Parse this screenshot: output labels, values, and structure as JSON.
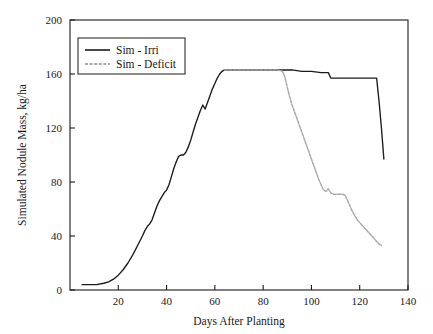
{
  "chart_data": {
    "type": "line",
    "title": "",
    "xlabel": "Days After Planting",
    "ylabel": "Simulated Nodule Mass, kg/ha",
    "xlim": [
      0,
      140
    ],
    "ylim": [
      0,
      200
    ],
    "xticks": [
      20,
      40,
      60,
      80,
      100,
      120,
      140
    ],
    "yticks": [
      0,
      40,
      80,
      120,
      160,
      200
    ],
    "grid": false,
    "legend_position": "top-left",
    "series": [
      {
        "name": "Sim - Irri",
        "color": "#1a1a1a",
        "style": "solid",
        "points": [
          [
            5,
            4
          ],
          [
            8,
            4
          ],
          [
            11,
            4
          ],
          [
            14,
            5
          ],
          [
            16,
            6
          ],
          [
            18,
            8
          ],
          [
            20,
            11
          ],
          [
            22,
            15
          ],
          [
            24,
            20
          ],
          [
            26,
            26
          ],
          [
            28,
            33
          ],
          [
            30,
            40
          ],
          [
            31,
            44
          ],
          [
            32,
            47
          ],
          [
            33,
            49
          ],
          [
            34,
            52
          ],
          [
            35,
            57
          ],
          [
            36,
            62
          ],
          [
            37,
            66
          ],
          [
            38,
            69
          ],
          [
            39,
            72
          ],
          [
            40,
            74
          ],
          [
            41,
            78
          ],
          [
            42,
            84
          ],
          [
            43,
            90
          ],
          [
            44,
            95
          ],
          [
            45,
            99
          ],
          [
            46,
            100
          ],
          [
            47,
            100
          ],
          [
            48,
            102
          ],
          [
            49,
            106
          ],
          [
            50,
            111
          ],
          [
            51,
            117
          ],
          [
            52,
            123
          ],
          [
            53,
            128
          ],
          [
            54,
            133
          ],
          [
            55,
            137
          ],
          [
            56,
            134
          ],
          [
            57,
            139
          ],
          [
            58,
            144
          ],
          [
            59,
            149
          ],
          [
            60,
            153
          ],
          [
            61,
            157
          ],
          [
            62,
            160
          ],
          [
            63,
            162
          ],
          [
            64,
            163
          ],
          [
            66,
            163
          ],
          [
            70,
            163
          ],
          [
            75,
            163
          ],
          [
            80,
            163
          ],
          [
            85,
            163
          ],
          [
            88,
            163
          ],
          [
            92,
            163
          ],
          [
            96,
            162
          ],
          [
            100,
            162
          ],
          [
            104,
            161
          ],
          [
            107,
            161
          ],
          [
            108,
            157
          ],
          [
            112,
            157
          ],
          [
            116,
            157
          ],
          [
            120,
            157
          ],
          [
            124,
            157
          ],
          [
            127,
            157
          ],
          [
            128,
            140
          ],
          [
            129,
            120
          ],
          [
            130,
            97
          ]
        ]
      },
      {
        "name": "Sim - Deficit",
        "color": "#a8a8a8",
        "style": "dashed",
        "points": [
          [
            64,
            163
          ],
          [
            70,
            163
          ],
          [
            75,
            163
          ],
          [
            80,
            163
          ],
          [
            84,
            163
          ],
          [
            86,
            163
          ],
          [
            88,
            162
          ],
          [
            89,
            158
          ],
          [
            90,
            150
          ],
          [
            91,
            143
          ],
          [
            92,
            137
          ],
          [
            93,
            132
          ],
          [
            94,
            127
          ],
          [
            95,
            122
          ],
          [
            96,
            117
          ],
          [
            97,
            112
          ],
          [
            98,
            107
          ],
          [
            99,
            102
          ],
          [
            100,
            97
          ],
          [
            101,
            92
          ],
          [
            102,
            87
          ],
          [
            103,
            82
          ],
          [
            104,
            78
          ],
          [
            105,
            74
          ],
          [
            106,
            73
          ],
          [
            107,
            75
          ],
          [
            108,
            72
          ],
          [
            109,
            71
          ],
          [
            110,
            71
          ],
          [
            111,
            71
          ],
          [
            112,
            71
          ],
          [
            113,
            71
          ],
          [
            114,
            70
          ],
          [
            115,
            66
          ],
          [
            116,
            62
          ],
          [
            117,
            58
          ],
          [
            118,
            55
          ],
          [
            119,
            52
          ],
          [
            120,
            50
          ],
          [
            121,
            48
          ],
          [
            122,
            46
          ],
          [
            123,
            44
          ],
          [
            124,
            42
          ],
          [
            125,
            40
          ],
          [
            126,
            38
          ],
          [
            127,
            36
          ],
          [
            128,
            34
          ],
          [
            129,
            33
          ]
        ]
      }
    ]
  },
  "legend": {
    "items": [
      {
        "label": "Sim - Irri"
      },
      {
        "label": "Sim - Deficit"
      }
    ]
  }
}
